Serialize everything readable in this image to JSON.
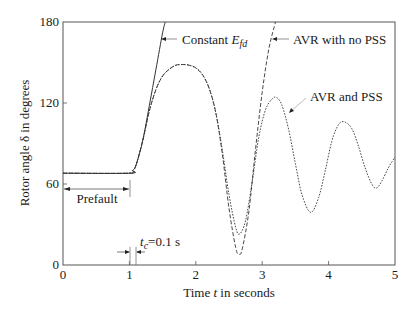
{
  "chart_data": {
    "type": "line",
    "title": "",
    "xlabel": "Time t in seconds",
    "xlabel_parts": {
      "pre": "Time ",
      "italic": "t",
      "post": " in seconds"
    },
    "ylabel": "Rotor angle δ in degrees",
    "xlim": [
      0,
      5
    ],
    "ylim": [
      0,
      180
    ],
    "xticks": [
      0,
      1,
      2,
      3,
      4,
      5
    ],
    "xtick_labels": [
      "0",
      "1",
      "2",
      "3",
      "4",
      "5"
    ],
    "yticks": [
      0,
      60,
      120,
      180
    ],
    "ytick_labels": [
      "0",
      "60",
      "120",
      "180"
    ],
    "grid": false,
    "legend": "inline annotations",
    "series": [
      {
        "name": "Constant E_fd",
        "label_parts": {
          "pre": "Constant ",
          "italic": "E",
          "sub": "fd"
        },
        "style": "solid",
        "x": [
          0,
          1.0,
          1.05,
          1.1,
          1.2,
          1.3,
          1.4,
          1.5,
          1.54
        ],
        "y": [
          68,
          68,
          70,
          74,
          92,
          118,
          145,
          172,
          180
        ]
      },
      {
        "name": "AVR with no PSS",
        "style": "dashed",
        "x": [
          0,
          1.0,
          1.05,
          1.1,
          1.2,
          1.3,
          1.4,
          1.5,
          1.6,
          1.7,
          1.8,
          1.9,
          2.0,
          2.1,
          2.2,
          2.3,
          2.4,
          2.5,
          2.6,
          2.65,
          2.7,
          2.8,
          2.9,
          3.0,
          3.1,
          3.2
        ],
        "y": [
          68,
          68,
          70,
          74,
          92,
          114,
          130,
          140,
          145,
          148,
          148.5,
          148,
          146,
          141,
          131,
          113,
          82,
          42,
          13,
          8,
          12,
          40,
          86,
          128,
          160,
          180
        ]
      },
      {
        "name": "AVR and PSS",
        "style": "dotted",
        "x": [
          0,
          1.0,
          1.05,
          1.1,
          1.2,
          1.3,
          1.4,
          1.5,
          1.6,
          1.7,
          1.8,
          1.9,
          2.0,
          2.1,
          2.2,
          2.3,
          2.4,
          2.5,
          2.6,
          2.66,
          2.75,
          2.85,
          2.95,
          3.05,
          3.15,
          3.22,
          3.3,
          3.4,
          3.5,
          3.6,
          3.73,
          3.85,
          3.95,
          4.05,
          4.15,
          4.24,
          4.35,
          4.45,
          4.55,
          4.65,
          4.72,
          4.8,
          4.9,
          5.0
        ],
        "y": [
          68,
          68,
          70,
          74,
          92,
          114,
          130,
          140,
          145,
          148,
          148.5,
          148,
          146,
          141,
          131,
          113,
          85,
          52,
          28,
          23,
          33,
          62,
          95,
          115,
          123,
          124,
          118,
          100,
          75,
          52,
          39,
          50,
          70,
          92,
          104,
          106,
          101,
          88,
          72,
          60,
          57,
          62,
          72,
          80
        ]
      }
    ],
    "annotations": [
      {
        "text": "Prefault",
        "type": "double-arrow span",
        "x_range": [
          0,
          1.0
        ],
        "y": 56
      },
      {
        "text": "t_c=0.1 s",
        "text_parts": {
          "italic": "t",
          "sub": "c",
          "post": "=0.1 s"
        },
        "type": "arrows marking interval",
        "x_range": [
          1.0,
          1.1
        ],
        "y": 13
      },
      {
        "text": "Constant E_fd",
        "points_to": "Constant E_fd"
      },
      {
        "text": "AVR with no PSS",
        "points_to": "AVR with no PSS"
      },
      {
        "text": "AVR and PSS",
        "points_to": "AVR and PSS"
      }
    ]
  }
}
